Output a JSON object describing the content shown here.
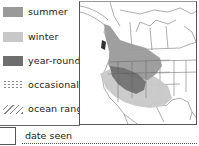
{
  "legend": {
    "items": [
      {
        "label": "summer",
        "icon": "solid-swatch",
        "color": "#9a9a9a"
      },
      {
        "label": "winter",
        "icon": "solid-swatch",
        "color": "#c8c8c8"
      },
      {
        "label": "year-round",
        "icon": "solid-swatch",
        "color": "#6e6e6e"
      },
      {
        "label": "occasional",
        "icon": "dotted-swatch",
        "color": "#8a8a8a"
      },
      {
        "label": "ocean range",
        "icon": "hatch-swatch",
        "color": "#888888"
      }
    ]
  },
  "map": {
    "subject": "range-map-north-america",
    "colors": {
      "summer": "#9a9a9a",
      "winter": "#c8c8c8",
      "year_round": "#6e6e6e",
      "border": "#555555"
    }
  },
  "footer": {
    "date_label": "date seen",
    "date_value": ""
  }
}
